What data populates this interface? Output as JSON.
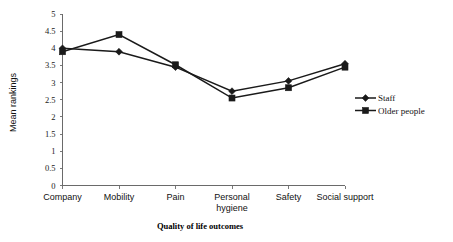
{
  "chart_data": {
    "type": "line",
    "title": "",
    "xlabel": "Quality of life outcomes",
    "ylabel": "Mean rankings",
    "categories": [
      "Company",
      "Mobility",
      "Pain",
      "Personal hygiene",
      "Safety",
      "Social support"
    ],
    "category_lines": [
      [
        "Company"
      ],
      [
        "Mobility"
      ],
      [
        "Pain"
      ],
      [
        "Personal",
        "hygiene"
      ],
      [
        "Safety"
      ],
      [
        "Social support"
      ]
    ],
    "ylim": [
      0,
      5
    ],
    "ytick_labels": [
      "0",
      "0.5",
      "1",
      "1.5",
      "2",
      "2.5",
      "3",
      "3.5",
      "4",
      "4.5",
      "5"
    ],
    "ytick_values": [
      0,
      0.5,
      1,
      1.5,
      2,
      2.5,
      3,
      3.5,
      4,
      4.5,
      5
    ],
    "grid": false,
    "legend_position": "right",
    "series": [
      {
        "name": "Staff",
        "marker": "diamond",
        "color": "#1a1a1a",
        "values": [
          4.0,
          3.9,
          3.45,
          2.75,
          3.05,
          3.55
        ]
      },
      {
        "name": "Older people",
        "marker": "square",
        "color": "#1a1a1a",
        "values": [
          3.9,
          4.4,
          3.52,
          2.55,
          2.85,
          3.45
        ]
      }
    ]
  },
  "legend": {
    "items": [
      {
        "label": "Staff",
        "marker": "diamond-marker"
      },
      {
        "label": "Older people",
        "marker": "square-marker"
      }
    ]
  }
}
